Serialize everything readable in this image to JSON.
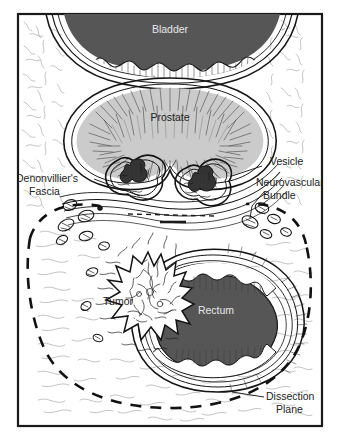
{
  "figure": {
    "kind": "medical-illustration",
    "frame": {
      "border_color": "#1a1a1a",
      "background_color": "#ffffff",
      "page_background": "#ffffff"
    },
    "colors": {
      "bladder_lumen": "#565656",
      "rectum_lumen": "#565656",
      "prostate_fill": "#cbcbcb",
      "tissue_fill": "#ffffff",
      "ink": "#1a1a1a",
      "label_dark": "#232323",
      "label_light": "#e8e8e8",
      "dissection_dash": "#111111"
    }
  },
  "labels": {
    "bladder": "Bladder",
    "prostate": "Prostate",
    "vesicle": "Vesicle",
    "neurovascular_line1": "Neurovascular",
    "neurovascular_line2": "Bundle",
    "denonvilliers_line1": "Denonvillier's",
    "denonvilliers_line2": "Fascia",
    "tumor": "Tumor",
    "rectum": "Rectum",
    "dissection_line1": "Dissection",
    "dissection_line2": "Plane"
  }
}
